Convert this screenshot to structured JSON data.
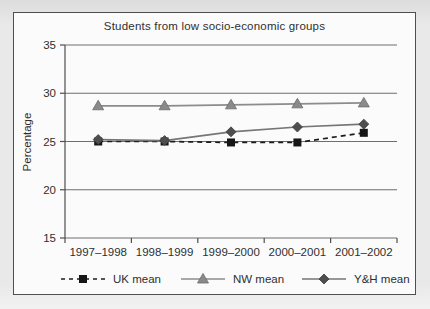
{
  "chart": {
    "title": "Students from low socio-economic groups",
    "ylabel": "Percentage"
  },
  "chart_data": {
    "type": "line",
    "title": "Students from low socio-economic groups",
    "xlabel": "",
    "ylabel": "Percentage",
    "categories": [
      "1997–1998",
      "1998–1999",
      "1999–2000",
      "2000–2001",
      "2001–2002"
    ],
    "series": [
      {
        "name": "UK mean",
        "values": [
          25.0,
          25.0,
          24.9,
          24.9,
          25.9
        ],
        "color": "#1c1c1c",
        "marker_color": "#161616",
        "line_style": "dashed",
        "marker": "square"
      },
      {
        "name": "NW mean",
        "values": [
          28.7,
          28.7,
          28.8,
          28.9,
          29.0
        ],
        "color": "#8c8c8c",
        "marker_color": "#8a8a8a",
        "line_style": "solid",
        "marker": "triangle"
      },
      {
        "name": "Y&H mean",
        "values": [
          25.2,
          25.1,
          26.0,
          26.5,
          26.8
        ],
        "color": "#767676",
        "marker_color": "#4e4e4e",
        "line_style": "solid",
        "marker": "diamond"
      }
    ],
    "ylim": [
      15,
      35
    ],
    "ytick_step": 5,
    "grid": true,
    "legend_position": "bottom",
    "colors": {
      "gridline": "#6e6e6e",
      "axis": "#4f4f4f",
      "frame_border": "#4f4f4f",
      "text": "#2f2f2f",
      "background": "#fbfbfb",
      "page_background": "#e6e6e6"
    }
  }
}
